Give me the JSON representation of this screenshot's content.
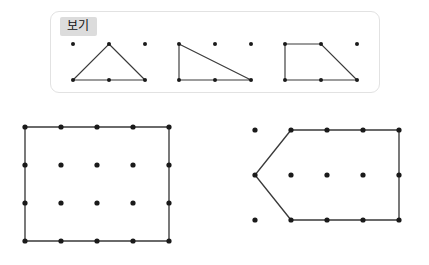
{
  "page": {
    "background_color": "#ffffff",
    "width": 429,
    "height": 265
  },
  "reference_panel": {
    "label": "보기",
    "label_background_color": "#dcdcdc",
    "border_color": "#e2e2e2",
    "shapes": [
      {
        "name": "triangle",
        "grid": {
          "cols": 3,
          "rows": 2,
          "spacing_x": 36,
          "spacing_y": 36
        },
        "dots": [
          [
            0,
            0
          ],
          [
            1,
            0
          ],
          [
            2,
            0
          ],
          [
            0,
            1
          ],
          [
            1,
            1
          ],
          [
            2,
            1
          ]
        ],
        "vertices": [
          [
            1,
            0
          ],
          [
            2,
            1
          ],
          [
            0,
            1
          ]
        ],
        "closed": true
      },
      {
        "name": "right-triangle",
        "grid": {
          "cols": 3,
          "rows": 2,
          "spacing_x": 36,
          "spacing_y": 36
        },
        "dots": [
          [
            0,
            0
          ],
          [
            1,
            0
          ],
          [
            2,
            0
          ],
          [
            0,
            1
          ],
          [
            1,
            1
          ],
          [
            2,
            1
          ]
        ],
        "vertices": [
          [
            0,
            0
          ],
          [
            2,
            1
          ],
          [
            0,
            1
          ]
        ],
        "closed": true
      },
      {
        "name": "trapezoid",
        "grid": {
          "cols": 3,
          "rows": 2,
          "spacing_x": 36,
          "spacing_y": 36
        },
        "dots": [
          [
            0,
            0
          ],
          [
            1,
            0
          ],
          [
            2,
            0
          ],
          [
            0,
            1
          ],
          [
            1,
            1
          ],
          [
            2,
            1
          ]
        ],
        "vertices": [
          [
            0,
            0
          ],
          [
            1,
            0
          ],
          [
            2,
            1
          ],
          [
            0,
            1
          ]
        ],
        "closed": true
      }
    ]
  },
  "figures": [
    {
      "name": "rectangle-figure",
      "grid": {
        "cols": 5,
        "rows": 4,
        "spacing_x": 36,
        "spacing_y": 38
      },
      "vertices": [
        [
          0,
          0
        ],
        [
          4,
          0
        ],
        [
          4,
          3
        ],
        [
          0,
          3
        ]
      ],
      "closed": true,
      "dot_color": "#1a1a1a",
      "edge_color": "#3a3a3a"
    },
    {
      "name": "arrow-pentagon-figure",
      "grid": {
        "cols": 5,
        "rows": 3,
        "spacing_x": 36,
        "spacing_y": 45
      },
      "vertices": [
        [
          1,
          0
        ],
        [
          4,
          0
        ],
        [
          4,
          2
        ],
        [
          1,
          2
        ],
        [
          0,
          1
        ]
      ],
      "closed": true,
      "dot_color": "#1a1a1a",
      "edge_color": "#3a3a3a"
    }
  ]
}
